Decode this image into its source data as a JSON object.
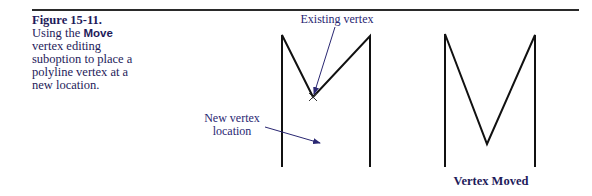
{
  "caption": {
    "figure_number": "Figure 15-11.",
    "text_before": "Using the ",
    "keyword": "Move",
    "text_after": " vertex editing suboption to place a polyline vertex at a new location."
  },
  "left_diagram": {
    "callout_existing": "Existing vertex",
    "callout_new_line1": "New vertex",
    "callout_new_line2": "location"
  },
  "right_diagram": {
    "label": "Vertex Moved"
  },
  "colors": {
    "line": "#111111",
    "callout": "#2a2772",
    "rule": "#2a2a2a"
  }
}
